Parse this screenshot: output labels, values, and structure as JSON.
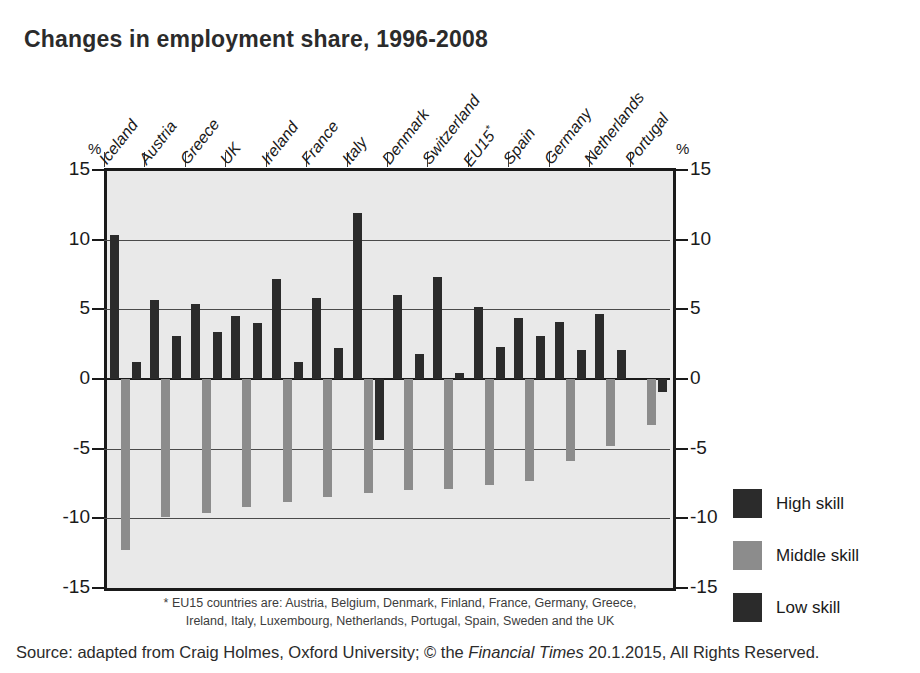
{
  "title": "Changes in employment share, 1996-2008",
  "axis": {
    "percent_symbol": "%",
    "tick_labels": [
      "15",
      "10",
      "5",
      "0",
      "-5",
      "-10",
      "-15"
    ]
  },
  "legend": {
    "items": [
      {
        "label": "High skill",
        "key": "high",
        "color": "#2b2b2b"
      },
      {
        "label": "Middle skill",
        "key": "middle",
        "color": "#8c8c8c"
      },
      {
        "label": "Low skill",
        "key": "low",
        "color": "#2b2b2b"
      }
    ]
  },
  "footnote": "* EU15 countries are: Austria, Belgium, Denmark, Finland, France, Germany, Greece, Ireland, Italy, Luxembourg, Netherlands, Portugal, Spain, Sweden and the UK",
  "source": {
    "prefix": "Source: adapted from Craig Holmes, Oxford University; © the ",
    "italic": "Financial Times",
    "suffix": " 20.1.2015, All Rights Reserved."
  },
  "chart_data": {
    "type": "bar",
    "title": "Changes in employment share, 1996-2008",
    "xlabel": "",
    "ylabel": "%",
    "ylim": [
      -15,
      15
    ],
    "yticks": [
      15,
      10,
      5,
      0,
      -5,
      -10,
      -15
    ],
    "grid": true,
    "legend_position": "right",
    "categories": [
      "Iceland",
      "Austria",
      "Greece",
      "UK",
      "Ireland",
      "France",
      "Italy",
      "Denmark",
      "Switzerland",
      "EU15*",
      "Spain",
      "Germany",
      "Netherlands",
      "Portugal"
    ],
    "series": [
      {
        "name": "High skill",
        "color": "#2b2b2b",
        "values": [
          10.3,
          5.7,
          5.4,
          4.5,
          7.2,
          5.8,
          11.9,
          6.0,
          7.3,
          5.2,
          4.4,
          4.1,
          4.7,
          0.0
        ]
      },
      {
        "name": "Middle skill",
        "color": "#8c8c8c",
        "values": [
          -12.3,
          -9.9,
          -9.6,
          -9.2,
          -8.8,
          -8.5,
          -8.2,
          -8.0,
          -7.9,
          -7.6,
          -7.3,
          -5.9,
          -4.8,
          -3.3
        ]
      },
      {
        "name": "Low skill",
        "color": "#2b2b2b",
        "values": [
          1.2,
          3.1,
          3.4,
          4.0,
          1.2,
          2.2,
          -4.4,
          1.8,
          0.4,
          2.3,
          3.1,
          2.1,
          2.1,
          -0.9
        ]
      }
    ],
    "notes": [
      "Italy high skill is the tallest positive bar at about 11.9%",
      "Iceland middle skill is the deepest negative bar at about -12.3%",
      "France (Italy column group) shows a negative low-skill bar of about -4.4%",
      "Portugal shows a small negative low-skill bar of about -0.9%"
    ]
  }
}
